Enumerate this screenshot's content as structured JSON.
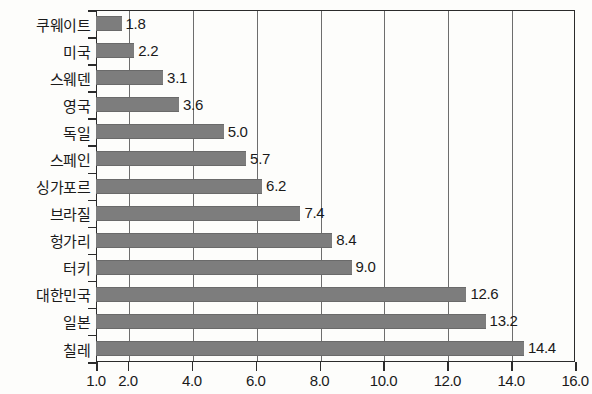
{
  "chart_data": {
    "type": "bar",
    "orientation": "horizontal",
    "title": "",
    "subtitle": "",
    "xlabel": "",
    "ylabel": "",
    "categories": [
      "쿠웨이트",
      "미국",
      "스웨덴",
      "영국",
      "독일",
      "스페인",
      "싱가포르",
      "브라질",
      "헝가리",
      "터키",
      "대한민국",
      "일본",
      "칠레"
    ],
    "values": [
      1.8,
      2.2,
      3.1,
      3.6,
      5.0,
      5.7,
      6.2,
      7.4,
      8.4,
      9.0,
      12.6,
      13.2,
      14.4
    ],
    "value_labels": [
      "1.8",
      "2.2",
      "3.1",
      "3.6",
      "5.0",
      "5.7",
      "6.2",
      "7.4",
      "8.4",
      "9.0",
      "12.6",
      "13.2",
      "14.4"
    ],
    "xlim": [
      1.0,
      16.0
    ],
    "xticks": [
      1.0,
      2.0,
      4.0,
      6.0,
      8.0,
      10.0,
      12.0,
      14.0,
      16.0
    ],
    "xtick_labels": [
      "1.0",
      "2.0",
      "4.0",
      "6.0",
      "8.0",
      "10.0",
      "12.0",
      "14.0",
      "16.0"
    ],
    "grid": true,
    "grid_axis": "x",
    "legend": false,
    "legend_position": "none",
    "bar_color": "#7d7d7d",
    "axis_color": "#2b2b2b",
    "grid_color": "#6d6d6d",
    "background_color": "#fdfdfb",
    "text_color": "#1a1a1a"
  }
}
